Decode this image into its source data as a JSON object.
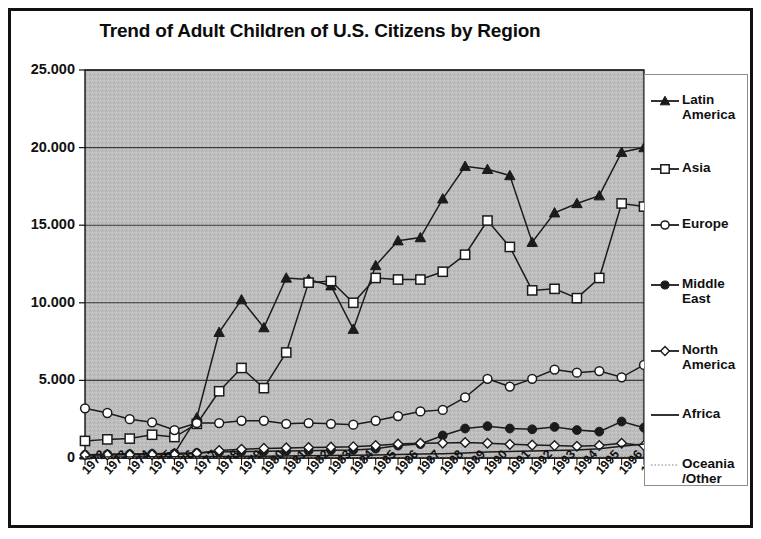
{
  "chart_data": {
    "type": "line",
    "title": "Trend of Adult Children of U.S. Citizens by Region",
    "xlabel": "",
    "ylabel": "",
    "ylim": [
      0,
      25000
    ],
    "grid": true,
    "legend_position": "right",
    "y_ticks": [
      0,
      5000,
      10000,
      15000,
      20000,
      25000
    ],
    "y_tick_labels": [
      "0",
      "5.000",
      "10.000",
      "15.000",
      "20.000",
      "25.000"
    ],
    "categories": [
      "1972",
      "1973",
      "1974",
      "1975",
      "1976",
      "1977",
      "1978",
      "1979",
      "1980",
      "1981",
      "1982",
      "1983",
      "1984",
      "1985",
      "1986",
      "1987",
      "1988",
      "1989",
      "1990",
      "1991",
      "1992",
      "1993",
      "1994",
      "1995",
      "1996",
      "1997"
    ],
    "series": [
      {
        "name": "Latin America",
        "marker": "filled-triangle",
        "values": [
          200,
          230,
          250,
          260,
          300,
          2600,
          8100,
          10200,
          8400,
          11600,
          11500,
          11100,
          8300,
          12400,
          14000,
          14200,
          16700,
          18800,
          18600,
          18200,
          13900,
          15800,
          16400,
          16900,
          19700,
          20000
        ]
      },
      {
        "name": "Asia",
        "marker": "open-square",
        "values": [
          1100,
          1200,
          1250,
          1500,
          1350,
          2200,
          4300,
          5800,
          4500,
          6800,
          11300,
          11400,
          10000,
          11600,
          11500,
          11500,
          12000,
          13100,
          15300,
          13600,
          10800,
          10900,
          10300,
          11600,
          16400,
          16200
        ]
      },
      {
        "name": "Europe",
        "marker": "open-circle",
        "values": [
          3200,
          2900,
          2500,
          2300,
          1800,
          2250,
          2250,
          2400,
          2400,
          2200,
          2250,
          2200,
          2150,
          2400,
          2700,
          3000,
          3100,
          3900,
          5100,
          4600,
          5100,
          5700,
          5500,
          5600,
          5200,
          6000
        ]
      },
      {
        "name": "Middle East",
        "marker": "filled-circle",
        "values": [
          210,
          240,
          250,
          270,
          300,
          330,
          380,
          420,
          430,
          450,
          470,
          500,
          520,
          600,
          800,
          900,
          1450,
          1900,
          2050,
          1900,
          1850,
          2000,
          1800,
          1700,
          2350,
          1950
        ]
      },
      {
        "name": "North America",
        "marker": "open-diamond",
        "values": [
          190,
          200,
          210,
          215,
          230,
          300,
          480,
          560,
          620,
          650,
          680,
          700,
          730,
          800,
          900,
          950,
          960,
          1000,
          950,
          880,
          830,
          800,
          760,
          800,
          950,
          800
        ]
      },
      {
        "name": "Africa",
        "marker": "none",
        "values": [
          60,
          70,
          70,
          80,
          80,
          90,
          100,
          110,
          120,
          130,
          140,
          160,
          180,
          200,
          220,
          250,
          280,
          330,
          380,
          420,
          450,
          480,
          520,
          600,
          760,
          900
        ]
      },
      {
        "name": "Oceania\n/Other",
        "marker": "dotted",
        "values": [
          30,
          30,
          30,
          30,
          30,
          35,
          35,
          40,
          40,
          40,
          45,
          45,
          45,
          50,
          50,
          55,
          55,
          60,
          60,
          60,
          65,
          65,
          70,
          70,
          75,
          75
        ]
      }
    ]
  },
  "colors": {
    "plot_background": "#bdbdbd",
    "frame": "#111111",
    "gridline": "#3c3c3c",
    "series_line": "#1b1b1b",
    "marker_fill_open": "#ffffff",
    "page_background": "#ffffff"
  }
}
